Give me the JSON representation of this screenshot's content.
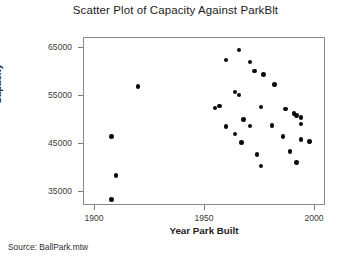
{
  "chart_data": {
    "type": "scatter",
    "title": "Scatter Plot of Capacity Against ParkBlt",
    "xlabel": "Year Park Built",
    "ylabel": "Capacity",
    "xlim": [
      1895,
      2005
    ],
    "ylim": [
      32000,
      67000
    ],
    "xticks": [
      1900,
      1950,
      2000
    ],
    "xtick_labels": [
      "1900",
      "1950",
      "2000"
    ],
    "yticks": [
      35000,
      45000,
      55000,
      65000
    ],
    "ytick_labels": [
      "35000",
      "45000",
      "55000",
      "65000"
    ],
    "grid": false,
    "legend": false,
    "marker": "filled-circle",
    "marker_color": "#0b0b0b",
    "points": [
      {
        "x": 1920,
        "y": 56700
      },
      {
        "x": 1908,
        "y": 46300
      },
      {
        "x": 1910,
        "y": 38100
      },
      {
        "x": 1908,
        "y": 33200
      },
      {
        "x": 1966,
        "y": 64300
      },
      {
        "x": 1960,
        "y": 62200
      },
      {
        "x": 1971,
        "y": 61800
      },
      {
        "x": 1977,
        "y": 59200
      },
      {
        "x": 1973,
        "y": 59900
      },
      {
        "x": 1964,
        "y": 55500
      },
      {
        "x": 1966,
        "y": 54900
      },
      {
        "x": 1957,
        "y": 52600
      },
      {
        "x": 1955,
        "y": 52200
      },
      {
        "x": 1976,
        "y": 52400
      },
      {
        "x": 1982,
        "y": 57100
      },
      {
        "x": 1987,
        "y": 52000
      },
      {
        "x": 1991,
        "y": 51100
      },
      {
        "x": 1992,
        "y": 50700
      },
      {
        "x": 1994,
        "y": 50200
      },
      {
        "x": 1968,
        "y": 49800
      },
      {
        "x": 1971,
        "y": 48500
      },
      {
        "x": 1994,
        "y": 48900
      },
      {
        "x": 1981,
        "y": 48600
      },
      {
        "x": 1967,
        "y": 45000
      },
      {
        "x": 1994,
        "y": 45600
      },
      {
        "x": 1998,
        "y": 45200
      },
      {
        "x": 1974,
        "y": 42500
      },
      {
        "x": 1989,
        "y": 43100
      },
      {
        "x": 1960,
        "y": 48300
      },
      {
        "x": 1992,
        "y": 40800
      },
      {
        "x": 1976,
        "y": 40100
      },
      {
        "x": 1964,
        "y": 46800
      },
      {
        "x": 1986,
        "y": 46300
      }
    ]
  },
  "footer": {
    "source_text": "Source: BallPark.mtw"
  }
}
